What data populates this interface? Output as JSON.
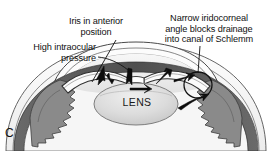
{
  "figure": {
    "panel_letter": "C",
    "title_text": ""
  },
  "labels": {
    "iris": "Iris in anterior\nposition",
    "pressure": "High intraocular\npressure",
    "angle": "Narrow iridocorneal\nangle blocks drainage\ninto canal of Schlemm",
    "lens": "LENS"
  },
  "colors": {
    "background": "#ffffff",
    "ink": "#111111",
    "outline": "#3a3a3a",
    "sclera_fill": "#f2f2f2",
    "cornea_fill": "#fbfbfb",
    "chamber_fill": "#ededed",
    "uvea_dark": "#5c5c5c",
    "ciliary_gray": "#8d8d8d",
    "lens_fill": "#d8d8d8",
    "lens_edge": "#8a8a8a",
    "arrow": "#0d0d0d",
    "highlight_circle": "#111111"
  },
  "annotations": {
    "leader_lines": 3,
    "flow_arrows": 7,
    "highlight_circle_label": "iridocorneal-angle-highlight"
  }
}
